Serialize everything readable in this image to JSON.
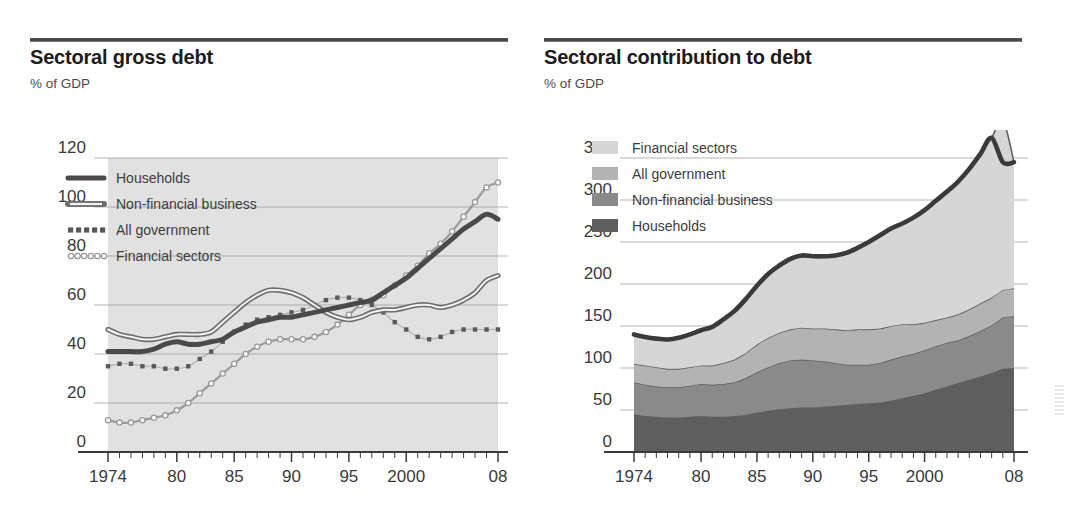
{
  "figure": {
    "background": "#ffffff",
    "panels": [
      {
        "id": "sectoral-gross-debt",
        "title": "Sectoral gross debt",
        "subtitle": "% of GDP"
      },
      {
        "id": "sectoral-contribution-to-debt",
        "title": "Sectoral contribution to debt",
        "subtitle": "% of GDP"
      }
    ]
  },
  "colors": {
    "households": "#4a4a4a",
    "non_financial_business": "#6e6e6e",
    "all_government": "#5a5a5a",
    "financial_sectors": "#9a9a9a",
    "fill_left": "#dcdcdc",
    "stack_households": "#5e5e5e",
    "stack_nonfin": "#8a8a8a",
    "stack_gov": "#b3b3b3",
    "stack_financial": "#d6d6d6",
    "total_line": "#3a3a3a",
    "grid": "#9b9b9b",
    "axis": "#3a3a3a",
    "text": "#2b2b2b"
  },
  "chart_data": [
    {
      "type": "line",
      "title": "Sectoral gross debt",
      "subtitle": "% of GDP",
      "xlabel": "",
      "ylabel": "% of GDP",
      "xlim": [
        1974,
        2008
      ],
      "ylim": [
        0,
        120
      ],
      "yticks": [
        0,
        20,
        40,
        60,
        80,
        100,
        120
      ],
      "xticks": [
        1974,
        1980,
        1985,
        1990,
        1995,
        2000,
        2008
      ],
      "xticklabels": [
        "1974",
        "80",
        "85",
        "90",
        "95",
        "2000",
        "08"
      ],
      "grid": true,
      "legend_position": "upper-left",
      "x": [
        1974,
        1975,
        1976,
        1977,
        1978,
        1979,
        1980,
        1981,
        1982,
        1983,
        1984,
        1985,
        1986,
        1987,
        1988,
        1989,
        1990,
        1991,
        1992,
        1993,
        1994,
        1995,
        1996,
        1997,
        1998,
        1999,
        2000,
        2001,
        2002,
        2003,
        2004,
        2005,
        2006,
        2007,
        2008
      ],
      "series": [
        {
          "name": "Households",
          "marker": "solid-thick",
          "values": [
            41,
            41,
            41,
            41,
            42,
            44,
            45,
            44,
            44,
            45,
            46,
            49,
            51,
            53,
            54,
            55,
            55,
            56,
            57,
            58,
            59,
            60,
            61,
            62,
            65,
            68,
            71,
            75,
            79,
            83,
            87,
            91,
            94,
            97,
            95
          ]
        },
        {
          "name": "Non-financial business",
          "marker": "double-line",
          "values": [
            50,
            48,
            47,
            46,
            46,
            47,
            48,
            48,
            48,
            49,
            53,
            57,
            61,
            64,
            66,
            66,
            65,
            63,
            60,
            57,
            55,
            54,
            55,
            57,
            58,
            58,
            59,
            60,
            60,
            59,
            60,
            62,
            65,
            70,
            72
          ]
        },
        {
          "name": "All government",
          "marker": "dotted-square",
          "values": [
            35,
            36,
            36,
            35,
            35,
            34,
            34,
            35,
            38,
            41,
            45,
            49,
            52,
            54,
            55,
            56,
            57,
            58,
            60,
            62,
            63,
            63,
            62,
            60,
            57,
            53,
            50,
            47,
            46,
            47,
            49,
            50,
            50,
            50,
            50
          ]
        },
        {
          "name": "Financial sectors",
          "marker": "open-circle",
          "values": [
            13,
            12,
            12,
            13,
            14,
            15,
            17,
            20,
            24,
            28,
            32,
            36,
            40,
            43,
            45,
            46,
            46,
            46,
            47,
            49,
            52,
            56,
            60,
            62,
            64,
            68,
            72,
            76,
            81,
            85,
            90,
            96,
            102,
            108,
            110
          ]
        }
      ]
    },
    {
      "type": "area",
      "stacked": true,
      "title": "Sectoral contribution to debt",
      "subtitle": "% of GDP",
      "xlabel": "",
      "ylabel": "% of GDP",
      "xlim": [
        1974,
        2008
      ],
      "ylim": [
        0,
        350
      ],
      "yticks": [
        0,
        50,
        100,
        150,
        200,
        250,
        300,
        350
      ],
      "xticks": [
        1974,
        1980,
        1985,
        1990,
        1995,
        2000,
        2008
      ],
      "xticklabels": [
        "1974",
        "80",
        "85",
        "90",
        "95",
        "2000",
        "08"
      ],
      "grid": true,
      "legend_position": "upper-left",
      "legend_order": [
        "Financial sectors",
        "All government",
        "Non-financial business",
        "Households"
      ],
      "x": [
        1974,
        1975,
        1976,
        1977,
        1978,
        1979,
        1980,
        1981,
        1982,
        1983,
        1984,
        1985,
        1986,
        1987,
        1988,
        1989,
        1990,
        1991,
        1992,
        1993,
        1994,
        1995,
        1996,
        1997,
        1998,
        1999,
        2000,
        2001,
        2002,
        2003,
        2004,
        2005,
        2006,
        2007,
        2008
      ],
      "series": [
        {
          "name": "Households",
          "values": [
            45,
            43,
            42,
            41,
            41,
            42,
            43,
            42,
            42,
            43,
            44,
            47,
            49,
            51,
            52,
            53,
            53,
            54,
            55,
            56,
            57,
            58,
            59,
            61,
            64,
            67,
            70,
            74,
            78,
            82,
            86,
            90,
            94,
            99,
            100
          ]
        },
        {
          "name": "Non-financial business",
          "values": [
            38,
            37,
            36,
            36,
            36,
            37,
            38,
            38,
            39,
            40,
            44,
            48,
            52,
            55,
            57,
            57,
            56,
            54,
            51,
            48,
            47,
            46,
            47,
            49,
            50,
            50,
            51,
            52,
            52,
            51,
            52,
            54,
            57,
            61,
            62
          ]
        },
        {
          "name": "All government",
          "values": [
            22,
            23,
            23,
            22,
            22,
            22,
            22,
            23,
            25,
            27,
            30,
            33,
            35,
            36,
            37,
            38,
            38,
            39,
            40,
            41,
            42,
            42,
            41,
            40,
            38,
            35,
            33,
            31,
            30,
            31,
            32,
            33,
            33,
            33,
            33
          ]
        },
        {
          "name": "Financial sectors",
          "values": [
            35,
            34,
            34,
            35,
            37,
            39,
            42,
            46,
            52,
            58,
            64,
            70,
            76,
            80,
            84,
            86,
            86,
            86,
            88,
            92,
            97,
            104,
            111,
            116,
            120,
            127,
            134,
            142,
            150,
            158,
            167,
            178,
            190,
            202,
            150
          ]
        }
      ],
      "total_line": {
        "name": "Total debt",
        "values": [
          140,
          137,
          135,
          134,
          136,
          140,
          145,
          149,
          158,
          168,
          182,
          198,
          212,
          222,
          230,
          234,
          233,
          233,
          234,
          237,
          243,
          250,
          258,
          266,
          272,
          279,
          288,
          299,
          310,
          322,
          337,
          355,
          374,
          345,
          345
        ]
      }
    }
  ]
}
